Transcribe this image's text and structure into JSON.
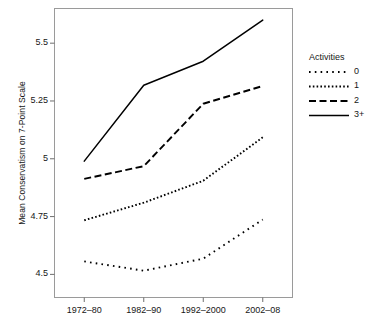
{
  "chart_data": {
    "type": "line",
    "title": "",
    "xlabel": "",
    "ylabel": "Mean Conservatism on 7-Point Scale",
    "categories": [
      "1972–80",
      "1982–90",
      "1992–2000",
      "2002–08"
    ],
    "ytick_labels": [
      "4.5",
      "4.75",
      "5",
      "5.25",
      "5.5"
    ],
    "ytick_values": [
      4.5,
      4.75,
      5.0,
      5.25,
      5.5
    ],
    "ylim": [
      4.4,
      5.65
    ],
    "grid": false,
    "legend_position": "right",
    "legend_title": "Activities",
    "series": [
      {
        "name": "0",
        "style": "dotted-sparse",
        "values": [
          4.556,
          4.516,
          4.568,
          4.737
        ]
      },
      {
        "name": "1",
        "style": "dotted-dense",
        "values": [
          4.734,
          4.81,
          4.905,
          5.093
        ]
      },
      {
        "name": "2",
        "style": "dashed",
        "values": [
          4.913,
          4.968,
          5.238,
          5.315
        ]
      },
      {
        "name": "3+",
        "style": "solid",
        "values": [
          4.99,
          5.318,
          5.422,
          5.6
        ]
      }
    ],
    "colors": {
      "line": "#000000",
      "panel_border": "#9a9a9a",
      "background": "#ffffff",
      "text": "#161616"
    }
  },
  "legend": {
    "title": "Activities",
    "items": [
      {
        "label": "0",
        "style": "dotted-sparse"
      },
      {
        "label": "1",
        "style": "dotted-dense"
      },
      {
        "label": "2",
        "style": "dashed"
      },
      {
        "label": "3+",
        "style": "solid"
      }
    ]
  }
}
